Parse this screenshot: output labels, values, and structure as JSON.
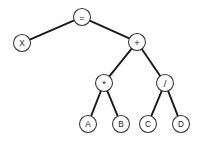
{
  "diagram": {
    "type": "binary-expression-tree",
    "background_color": "#ffffff",
    "edge_color": "#1a1a1a",
    "node_fill": "#ffffff",
    "node_stroke": "#3a3a3a",
    "node_radius": 8.5,
    "expression": "X = A * B + C / D",
    "nodes": [
      {
        "id": "eq",
        "label": "=",
        "kind": "operator",
        "x": 82,
        "y": 17
      },
      {
        "id": "x",
        "label": "X",
        "kind": "operand",
        "x": 22,
        "y": 43
      },
      {
        "id": "plus",
        "label": "+",
        "kind": "operator",
        "x": 137,
        "y": 42
      },
      {
        "id": "mul",
        "label": "*",
        "kind": "operator",
        "x": 104,
        "y": 83
      },
      {
        "id": "div",
        "label": "/",
        "kind": "operator",
        "x": 165,
        "y": 83
      },
      {
        "id": "a",
        "label": "A",
        "kind": "operand",
        "x": 88,
        "y": 124
      },
      {
        "id": "b",
        "label": "B",
        "kind": "operand",
        "x": 121,
        "y": 124
      },
      {
        "id": "c",
        "label": "C",
        "kind": "operand",
        "x": 148,
        "y": 124
      },
      {
        "id": "d",
        "label": "D",
        "kind": "operand",
        "x": 181,
        "y": 124
      }
    ],
    "edges": [
      {
        "id": "edge-eq-x",
        "from": "eq",
        "to": "x"
      },
      {
        "id": "edge-eq-plus",
        "from": "eq",
        "to": "plus"
      },
      {
        "id": "edge-plus-mul",
        "from": "plus",
        "to": "mul"
      },
      {
        "id": "edge-plus-div",
        "from": "plus",
        "to": "div"
      },
      {
        "id": "edge-mul-a",
        "from": "mul",
        "to": "a"
      },
      {
        "id": "edge-mul-b",
        "from": "mul",
        "to": "b"
      },
      {
        "id": "edge-div-c",
        "from": "div",
        "to": "c"
      },
      {
        "id": "edge-div-d",
        "from": "div",
        "to": "d"
      }
    ]
  }
}
